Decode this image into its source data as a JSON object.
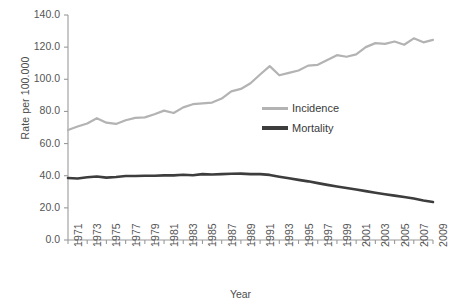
{
  "chart_data": {
    "type": "line",
    "title": "",
    "xlabel": "Year",
    "ylabel": "Rate per 100.000",
    "xlim": [
      1971,
      2009
    ],
    "ylim": [
      0.0,
      140.0
    ],
    "grid": false,
    "legend_position": "center-right",
    "ytick_labels": [
      "140.0",
      "120.0",
      "100.0",
      "80.0",
      "60.0",
      "40.0",
      "20.0",
      "0.0"
    ],
    "ytick_values": [
      140,
      120,
      100,
      80,
      60,
      40,
      20,
      0
    ],
    "xtick_labels": [
      "1971",
      "1973",
      "1975",
      "1977",
      "1979",
      "1981",
      "1983",
      "1985",
      "1987",
      "1989",
      "1991",
      "1993",
      "1995",
      "1997",
      "1999",
      "2001",
      "2003",
      "2005",
      "2007",
      "2009"
    ],
    "x": [
      1971,
      1972,
      1973,
      1974,
      1975,
      1976,
      1977,
      1978,
      1979,
      1980,
      1981,
      1982,
      1983,
      1984,
      1985,
      1986,
      1987,
      1988,
      1989,
      1990,
      1991,
      1992,
      1993,
      1994,
      1995,
      1996,
      1997,
      1998,
      1999,
      2000,
      2001,
      2002,
      2003,
      2004,
      2005,
      2006,
      2007,
      2008,
      2009
    ],
    "series": [
      {
        "name": "Incidence",
        "color": "#b3b3b3",
        "values": [
          68.4,
          70.6,
          72.5,
          75.8,
          73.0,
          72.2,
          74.5,
          76.0,
          76.3,
          78.2,
          80.5,
          79.0,
          82.5,
          84.5,
          85.0,
          85.5,
          88.0,
          92.5,
          94.0,
          97.5,
          103.0,
          108.2,
          102.5,
          104.0,
          105.5,
          108.5,
          109.0,
          112.0,
          115.0,
          114.0,
          115.5,
          120.0,
          122.5,
          122.0,
          123.5,
          121.5,
          125.5,
          123.0,
          124.5
        ]
      },
      {
        "name": "Mortality",
        "color": "#3d3d3d",
        "values": [
          38.6,
          38.3,
          39.0,
          39.5,
          38.8,
          39.2,
          39.8,
          39.8,
          40.0,
          40.0,
          40.2,
          40.2,
          40.6,
          40.3,
          41.0,
          40.8,
          41.0,
          41.2,
          41.3,
          41.0,
          41.0,
          40.5,
          39.4,
          38.4,
          37.4,
          36.5,
          35.4,
          34.3,
          33.3,
          32.3,
          31.4,
          30.4,
          29.4,
          28.5,
          27.6,
          26.8,
          25.8,
          24.6,
          23.6
        ]
      }
    ]
  },
  "legend": {
    "items": [
      {
        "label": "Incidence",
        "color": "#b3b3b3"
      },
      {
        "label": "Mortality",
        "color": "#3d3d3d"
      }
    ]
  },
  "axis": {
    "color": "#9a9a9a"
  }
}
